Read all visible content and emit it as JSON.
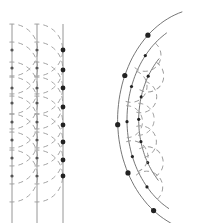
{
  "diagram": {
    "title": "",
    "panels": [
      {
        "name": "plane-wavefronts",
        "wavefront_color": "#8a8a8a",
        "wavelet_color": "#9a9a9a",
        "dot_color": "#555555",
        "wavefronts_x": [
          12,
          37,
          63
        ],
        "y_top": 24,
        "y_bottom": 223,
        "dot_rows_y": [
          50,
          68,
          88,
          103,
          122,
          140,
          158,
          176
        ],
        "wavelet_radius": 26
      },
      {
        "name": "spherical-wavefronts",
        "wavefront_color": "#666666",
        "wavelet_color": "#9a9a9a",
        "dot_color": "#222222",
        "center": [
          218,
          128
        ],
        "arc_radii": [
          73,
          89,
          104
        ]
      }
    ]
  }
}
